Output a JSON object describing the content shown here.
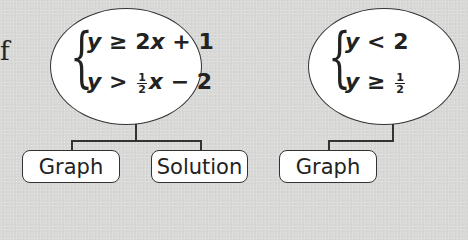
{
  "left_fragment": "f",
  "nodes": [
    {
      "system": {
        "line1": {
          "var": "y",
          "op": "≥",
          "rhs_coef": "2",
          "rhs_var": "x",
          "rhs_rest": "+ 1"
        },
        "line2": {
          "var": "y",
          "op": ">",
          "frac_num": "1",
          "frac_den": "2",
          "rhs_var": "x",
          "rhs_rest": "− 2"
        }
      },
      "children": [
        {
          "label": "Graph"
        },
        {
          "label": "Solution"
        }
      ]
    },
    {
      "system": {
        "line1": {
          "var": "y",
          "op": "<",
          "rhs_coef": "2"
        },
        "line2": {
          "var": "y",
          "op": "≥",
          "frac_num": "1",
          "frac_den": "2"
        }
      },
      "children": [
        {
          "label": "Graph"
        }
      ]
    }
  ],
  "colors": {
    "background": "#d9d9d7",
    "node_fill": "#ffffff",
    "stroke": "#333333",
    "text": "#222222"
  }
}
